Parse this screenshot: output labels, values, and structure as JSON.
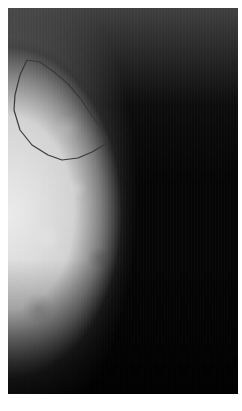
{
  "image": {
    "type": "mammogram",
    "view": "grayscale x-ray of breast tissue, chest wall at left edge",
    "background_color": "#050505",
    "margin_color": "#ffffff",
    "frame": {
      "x": 8,
      "y": 8,
      "width": 230,
      "height": 386
    }
  },
  "annotation": {
    "kind": "region-of-interest-contour",
    "stroke_color": "#3a3a3a",
    "points": [
      [
        27,
        60
      ],
      [
        20,
        75
      ],
      [
        15,
        95
      ],
      [
        14,
        110
      ],
      [
        20,
        130
      ],
      [
        32,
        145
      ],
      [
        48,
        155
      ],
      [
        62,
        160
      ],
      [
        78,
        158
      ],
      [
        92,
        152
      ],
      [
        104,
        145
      ],
      [
        108,
        140
      ],
      [
        98,
        124
      ],
      [
        88,
        110
      ],
      [
        80,
        98
      ],
      [
        68,
        84
      ],
      [
        54,
        72
      ],
      [
        40,
        62
      ],
      [
        27,
        60
      ]
    ]
  }
}
